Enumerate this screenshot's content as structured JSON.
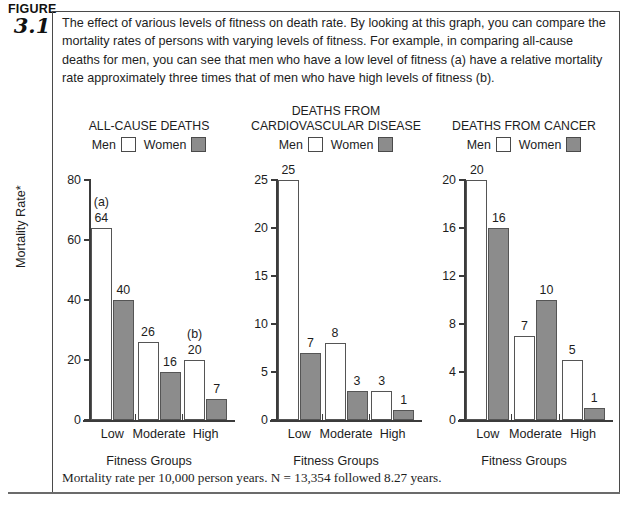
{
  "figure": {
    "label": "FIGURE",
    "number": "3.1"
  },
  "caption": "The effect of various levels of fitness on death rate. By looking at this graph, you can compare the mortality rates of persons with varying levels of fitness. For example, in comparing all-cause deaths for men, you can see that men who have a low level of fitness (a) have a relative mortality rate approximately three times that of men who have high levels of fitness (b).",
  "axis": {
    "y_title": "Mortality Rate*",
    "x_title": "Fitness Groups"
  },
  "legend": {
    "men_label": "Men",
    "women_label": "Women",
    "men_color": "#ffffff",
    "women_color": "#8c8c8c",
    "outline_color": "#4a4a4a"
  },
  "footnote": "Mortality rate per 10,000 person years. N = 13,354 followed 8.27 years.",
  "chart_data": [
    {
      "type": "bar",
      "title": "ALL-CAUSE DEATHS",
      "title_lines": [
        "ALL-CAUSE DEATHS"
      ],
      "xlabel": "Fitness Groups",
      "ylabel": "Mortality Rate*",
      "categories": [
        "Low",
        "Moderate",
        "High"
      ],
      "ylim": [
        0,
        80
      ],
      "yticks": [
        0,
        20,
        40,
        60,
        80
      ],
      "ytick_labels": [
        "0",
        "20",
        "40",
        "60",
        "80"
      ],
      "grid": false,
      "legend_position": "top",
      "series": [
        {
          "name": "Men",
          "color": "#ffffff",
          "values": [
            64,
            26,
            20
          ]
        },
        {
          "name": "Women",
          "color": "#8c8c8c",
          "values": [
            40,
            16,
            7
          ]
        }
      ],
      "annotations": [
        {
          "text": "(a)",
          "category": "Low",
          "series": "Men"
        },
        {
          "text": "(b)",
          "category": "High",
          "series": "Men"
        }
      ]
    },
    {
      "type": "bar",
      "title": "DEATHS FROM CARDIOVASCULAR DISEASE",
      "title_lines": [
        "DEATHS FROM",
        "CARDIOVASCULAR DISEASE"
      ],
      "xlabel": "Fitness Groups",
      "ylabel": "Mortality Rate*",
      "categories": [
        "Low",
        "Moderate",
        "High"
      ],
      "ylim": [
        0,
        25
      ],
      "yticks": [
        0,
        5,
        10,
        15,
        20,
        25
      ],
      "ytick_labels": [
        "0",
        "5",
        "10",
        "15",
        "20",
        "25"
      ],
      "grid": false,
      "legend_position": "top",
      "series": [
        {
          "name": "Men",
          "color": "#ffffff",
          "values": [
            25,
            8,
            3
          ]
        },
        {
          "name": "Women",
          "color": "#8c8c8c",
          "values": [
            7,
            3,
            1
          ]
        }
      ],
      "annotations": []
    },
    {
      "type": "bar",
      "title": "DEATHS FROM CANCER",
      "title_lines": [
        "DEATHS FROM CANCER"
      ],
      "xlabel": "Fitness Groups",
      "ylabel": "Mortality Rate*",
      "categories": [
        "Low",
        "Moderate",
        "High"
      ],
      "ylim": [
        0,
        20
      ],
      "yticks": [
        0,
        4,
        8,
        12,
        16,
        20
      ],
      "ytick_labels": [
        "0",
        "4",
        "8",
        "12",
        "16",
        "20"
      ],
      "grid": false,
      "legend_position": "top",
      "series": [
        {
          "name": "Men",
          "color": "#ffffff",
          "values": [
            20,
            7,
            5
          ]
        },
        {
          "name": "Women",
          "color": "#8c8c8c",
          "values": [
            16,
            10,
            1
          ]
        }
      ],
      "annotations": []
    }
  ]
}
